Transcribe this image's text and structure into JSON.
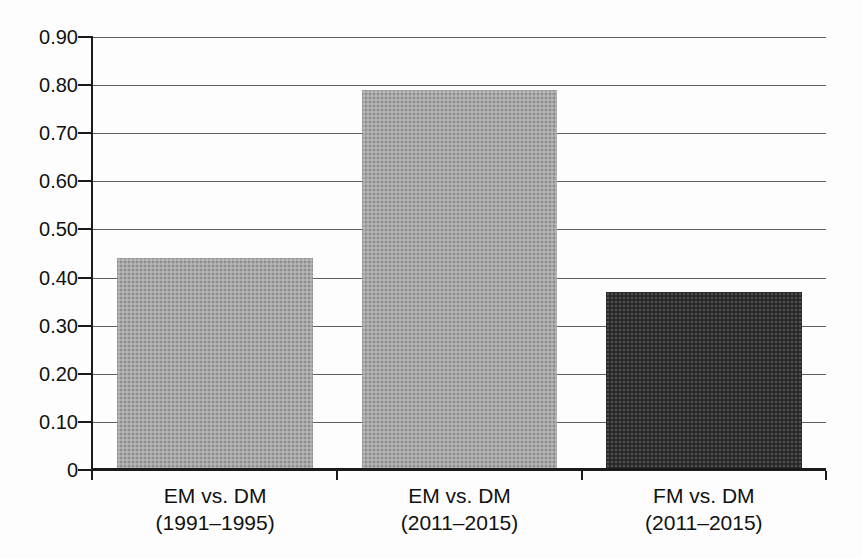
{
  "chart_data": {
    "type": "bar",
    "title": "",
    "xlabel": "",
    "ylabel": "",
    "categories": [
      "EM vs. DM (1991–1995)",
      "EM vs. DM (2011–2015)",
      "FM vs. DM (2011–2015)"
    ],
    "category_lines": [
      [
        "EM vs. DM",
        "(1991–1995)"
      ],
      [
        "EM vs. DM",
        "(2011–2015)"
      ],
      [
        "FM vs. DM",
        "(2011–2015)"
      ]
    ],
    "values": [
      0.44,
      0.79,
      0.37
    ],
    "bar_colors": [
      "#a9a9a9",
      "#a9a9a9",
      "#2f2f2f"
    ],
    "ylim": [
      0,
      0.9
    ],
    "ytick_interval": 0.1,
    "yticks": [
      {
        "value": 0.9,
        "label": "0.90"
      },
      {
        "value": 0.8,
        "label": "0.80"
      },
      {
        "value": 0.7,
        "label": "0.70"
      },
      {
        "value": 0.6,
        "label": "0.60"
      },
      {
        "value": 0.5,
        "label": "0.50"
      },
      {
        "value": 0.4,
        "label": "0.40"
      },
      {
        "value": 0.3,
        "label": "0.30"
      },
      {
        "value": 0.2,
        "label": "0.20"
      },
      {
        "value": 0.1,
        "label": "0.10"
      },
      {
        "value": 0.0,
        "label": "0"
      }
    ],
    "grid": true,
    "legend": false,
    "axis_color": "#1a1a1a",
    "gridline_color": "#5f5f5f",
    "text_color": "#111111",
    "background_color": "#fdfdfd"
  }
}
